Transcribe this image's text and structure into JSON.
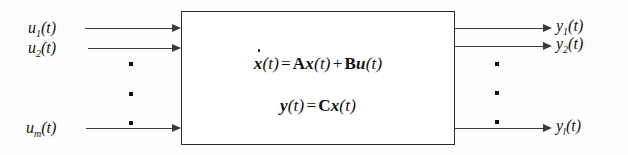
{
  "diagram": {
    "type": "block-diagram",
    "background_color": "#fefefe",
    "line_color": "#3a3a3a",
    "box_border_color": "#2b2b2b",
    "text_color": "#111111"
  },
  "system_block": {
    "equations": [
      {
        "id": "state-equation",
        "text": "ẋ(t) = Ax(t) + Bu(t)",
        "parts": {
          "lhs_var": "x",
          "lhs_arg": "(t)",
          "equals": "=",
          "matrix_a": "A",
          "state_var": "x",
          "state_arg": "(t)",
          "plus": "+",
          "matrix_b": "B",
          "input_var": "u",
          "input_arg": "(t)"
        }
      },
      {
        "id": "output-equation",
        "text": "y(t) = Cx(t)",
        "parts": {
          "lhs_var": "y",
          "lhs_arg": "(t)",
          "equals": "=",
          "matrix_c": "C",
          "state_var": "x",
          "state_arg": "(t)"
        }
      }
    ]
  },
  "inputs": {
    "signals": [
      {
        "name": "u",
        "subscript": "1",
        "arg": "(t)",
        "label": "u1(t)"
      },
      {
        "name": "u",
        "subscript": "2",
        "arg": "(t)",
        "label": "u2(t)"
      },
      {
        "name": "u",
        "subscript": "m",
        "arg": "(t)",
        "label": "um(t)"
      }
    ],
    "ellipsis_dots": 3
  },
  "outputs": {
    "signals": [
      {
        "name": "y",
        "subscript": "1",
        "arg": "(t)",
        "label": "y1(t)"
      },
      {
        "name": "y",
        "subscript": "2",
        "arg": "(t)",
        "label": "y2(t)"
      },
      {
        "name": "y",
        "subscript": "l",
        "arg": "(t)",
        "label": "yl(t)"
      }
    ],
    "ellipsis_dots": 3
  }
}
